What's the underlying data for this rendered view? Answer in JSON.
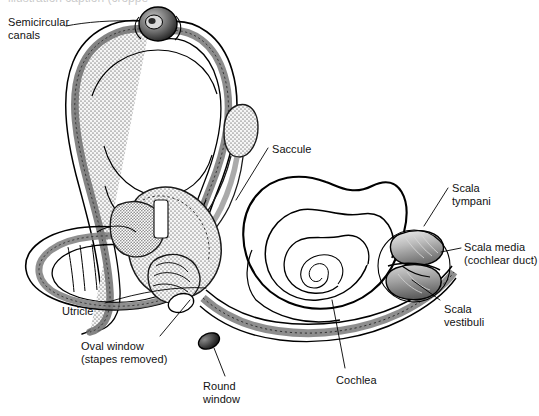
{
  "figure": {
    "background_color": "#ffffff",
    "ink_color": "#000000",
    "stipple_color": "#9b9b9b",
    "cropped_top_text": "illustration caption (cropped)"
  },
  "labels": {
    "semicircular_canals": "Semicircular\ncanals",
    "saccule": "Saccule",
    "scala_tympani": "Scala\ntympani",
    "scala_media": "Scala media\n(cochlear duct)",
    "scala_vestibuli": "Scala\nvestibuli",
    "utricle": "Utricle",
    "oval_window": "Oval window\n(stapes removed)",
    "round_window": "Round\nwindow",
    "cochlea": "Cochlea"
  },
  "label_positions": [
    {
      "key": "semicircular_canals",
      "x": 8,
      "y": 16,
      "align": "left"
    },
    {
      "key": "saccule",
      "x": 272,
      "y": 143,
      "align": "left"
    },
    {
      "key": "scala_tympani",
      "x": 452,
      "y": 182,
      "align": "left"
    },
    {
      "key": "scala_media",
      "x": 464,
      "y": 241,
      "align": "left"
    },
    {
      "key": "scala_vestibuli",
      "x": 444,
      "y": 303,
      "align": "left"
    },
    {
      "key": "utricle",
      "x": 62,
      "y": 305,
      "align": "left"
    },
    {
      "key": "oval_window",
      "x": 81,
      "y": 340,
      "align": "left"
    },
    {
      "key": "round_window",
      "x": 203,
      "y": 380,
      "align": "left"
    },
    {
      "key": "cochlea",
      "x": 336,
      "y": 374,
      "align": "left"
    }
  ],
  "anatomy_parts": [
    "anterior-semicircular-canal",
    "posterior-semicircular-canal",
    "lateral-semicircular-canal",
    "ampulla",
    "endolymphatic-sac",
    "utricle-chamber",
    "saccule-chamber",
    "vestibule",
    "cochlear-spiral",
    "cochlear-cross-section",
    "oval-window-opening",
    "round-window-opening"
  ]
}
